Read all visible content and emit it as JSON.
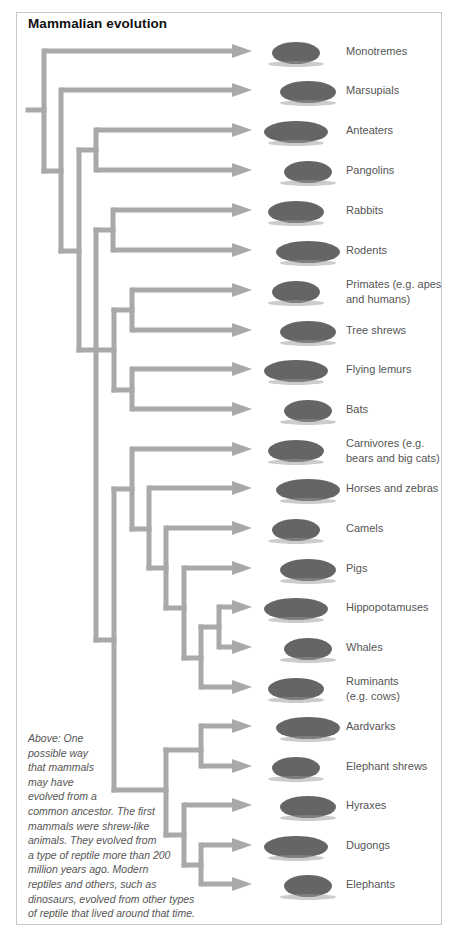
{
  "title": "Mammalian evolution",
  "colors": {
    "branch": "#a9a9a9",
    "border": "#c8c8c8",
    "label": "#555555",
    "title": "#111111"
  },
  "taxa": [
    {
      "label": "Monotremes",
      "icon": "platypus-illustration",
      "y": 51
    },
    {
      "label": "Marsupials",
      "icon": "sugar-glider-illustration",
      "y": 90
    },
    {
      "label": "Anteaters",
      "icon": "anteater-illustration",
      "y": 130
    },
    {
      "label": "Pangolins",
      "icon": "pangolin-illustration",
      "y": 170
    },
    {
      "label": "Rabbits",
      "icon": "rabbit-illustration",
      "y": 210
    },
    {
      "label": "Rodents",
      "icon": "rodent-illustration",
      "y": 250
    },
    {
      "label": "Primates (e.g. apes and humans)",
      "icon": "chimpanzee-illustration",
      "y": 290
    },
    {
      "label": "Tree shrews",
      "icon": "tree-shrew-illustration",
      "y": 330
    },
    {
      "label": "Flying lemurs",
      "icon": "flying-lemur-illustration",
      "y": 369
    },
    {
      "label": "Bats",
      "icon": "bat-illustration",
      "y": 409
    },
    {
      "label": "Carnivores (e.g. bears and big cats)",
      "icon": "cheetah-illustration",
      "y": 449
    },
    {
      "label": "Horses and zebras",
      "icon": "horse-illustration",
      "y": 488
    },
    {
      "label": "Camels",
      "icon": "camel-illustration",
      "y": 528
    },
    {
      "label": "Pigs",
      "icon": "boar-illustration",
      "y": 568
    },
    {
      "label": "Hippopotamuses",
      "icon": "hippopotamus-illustration",
      "y": 607
    },
    {
      "label": "Whales",
      "icon": "whale-illustration",
      "y": 647
    },
    {
      "label": "Ruminants (e.g. cows)",
      "icon": "buffalo-illustration",
      "y": 687
    },
    {
      "label": "Aardvarks",
      "icon": "aardvark-illustration",
      "y": 726
    },
    {
      "label": "Elephant shrews",
      "icon": "elephant-shrew-illustration",
      "y": 766
    },
    {
      "label": "Hyraxes",
      "icon": "hyrax-illustration",
      "y": 805
    },
    {
      "label": "Dugongs",
      "icon": "dugong-illustration",
      "y": 845
    },
    {
      "label": "Elephants",
      "icon": "elephant-illustration",
      "y": 884
    }
  ],
  "label_lines": {
    "6": [
      "Primates (e.g. apes",
      "and humans)"
    ],
    "10": [
      "Carnivores (e.g.",
      "bears and big cats)"
    ],
    "16": [
      "Ruminants",
      "(e.g. cows)"
    ]
  },
  "caption_lines": [
    "Above: One",
    "possible way",
    "that mammals",
    "may have",
    "evolved from a",
    "common ancestor. The first",
    "mammals were shrew-like",
    "animals. They evolved from",
    "a type of reptile more than 200",
    "million years ago. Modern",
    "reptiles and others, such as",
    "dinosaurs, evolved from other types",
    "of reptile that lived around that time."
  ],
  "arrows": [
    {
      "x": 44,
      "y": 51
    },
    {
      "x": 61,
      "y": 90
    },
    {
      "x": 96,
      "y": 130
    },
    {
      "x": 96,
      "y": 170
    },
    {
      "x": 113,
      "y": 210
    },
    {
      "x": 113,
      "y": 250
    },
    {
      "x": 132,
      "y": 290
    },
    {
      "x": 132,
      "y": 330
    },
    {
      "x": 132,
      "y": 369
    },
    {
      "x": 132,
      "y": 409
    },
    {
      "x": 132,
      "y": 449
    },
    {
      "x": 149,
      "y": 488
    },
    {
      "x": 166,
      "y": 528
    },
    {
      "x": 184,
      "y": 568
    },
    {
      "x": 219,
      "y": 607
    },
    {
      "x": 219,
      "y": 647
    },
    {
      "x": 201,
      "y": 687
    },
    {
      "x": 201,
      "y": 726
    },
    {
      "x": 201,
      "y": 766
    },
    {
      "x": 184,
      "y": 805
    },
    {
      "x": 201,
      "y": 845
    },
    {
      "x": 201,
      "y": 884
    }
  ],
  "segments": [
    [
      28,
      110,
      44,
      110
    ],
    [
      44,
      51,
      44,
      171
    ],
    [
      44,
      171,
      61,
      171
    ],
    [
      61,
      90,
      61,
      251
    ],
    [
      61,
      251,
      79,
      251
    ],
    [
      96,
      130,
      96,
      170
    ],
    [
      79,
      150,
      96,
      150
    ],
    [
      79,
      150,
      79,
      350
    ],
    [
      113,
      210,
      113,
      250
    ],
    [
      96,
      230,
      113,
      230
    ],
    [
      96,
      230,
      96,
      640
    ],
    [
      79,
      350,
      114,
      350
    ],
    [
      114,
      310,
      114,
      390
    ],
    [
      132,
      290,
      132,
      330
    ],
    [
      114,
      310,
      132,
      310
    ],
    [
      132,
      369,
      132,
      409
    ],
    [
      114,
      390,
      132,
      390
    ],
    [
      96,
      640,
      114,
      640
    ],
    [
      114,
      489,
      114,
      790
    ],
    [
      132,
      449,
      132,
      529
    ],
    [
      114,
      489,
      132,
      489
    ],
    [
      149,
      488,
      149,
      568
    ],
    [
      132,
      529,
      149,
      529
    ],
    [
      166,
      528,
      166,
      608
    ],
    [
      149,
      568,
      166,
      568
    ],
    [
      184,
      568,
      184,
      658
    ],
    [
      166,
      608,
      184,
      608
    ],
    [
      201,
      627,
      201,
      687
    ],
    [
      184,
      658,
      201,
      658
    ],
    [
      219,
      607,
      219,
      647
    ],
    [
      201,
      627,
      219,
      627
    ],
    [
      166,
      750,
      166,
      835
    ],
    [
      114,
      790,
      166,
      790
    ],
    [
      201,
      726,
      201,
      766
    ],
    [
      166,
      750,
      201,
      750
    ],
    [
      184,
      805,
      184,
      865
    ],
    [
      166,
      835,
      184,
      835
    ],
    [
      201,
      845,
      201,
      884
    ],
    [
      184,
      865,
      201,
      865
    ]
  ]
}
